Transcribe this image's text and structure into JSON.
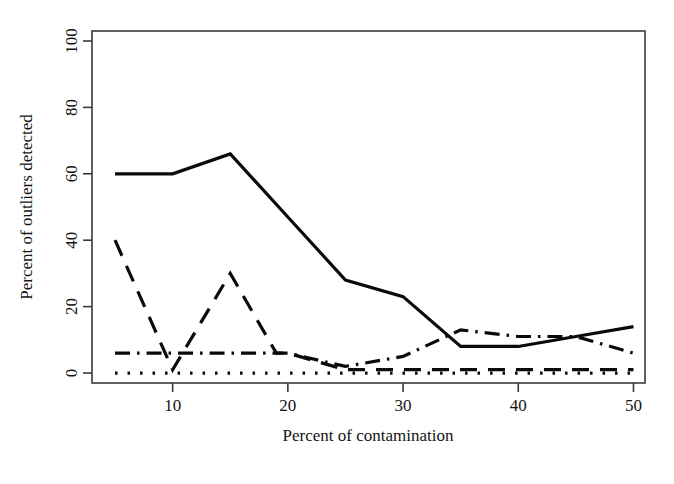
{
  "chart_data": {
    "type": "line",
    "title": "",
    "subtitle": "",
    "xlabel": "Percent of contamination",
    "ylabel": "Percent of outliers detected",
    "xlim": [
      3,
      51
    ],
    "ylim": [
      -3,
      103
    ],
    "xticks": [
      10,
      20,
      30,
      40,
      50
    ],
    "xtick_labels": [
      "10",
      "20",
      "30",
      "40",
      "50"
    ],
    "yticks": [
      0,
      20,
      40,
      60,
      80,
      100
    ],
    "ytick_labels": [
      "0",
      "20",
      "40",
      "60",
      "80",
      "100"
    ],
    "grid": false,
    "legend": "none",
    "frame": "box",
    "series": [
      {
        "name": "solid-line",
        "style": "solid",
        "color": "#0a0a0a",
        "width": 3.2,
        "x": [
          5,
          10,
          15,
          20,
          25,
          30,
          35,
          40,
          45,
          50
        ],
        "values": [
          60,
          60,
          66,
          47,
          28,
          23,
          8,
          8,
          11,
          14
        ]
      },
      {
        "name": "dashed-line",
        "style": "dashed",
        "color": "#0a0a0a",
        "width": 3.2,
        "x": [
          5,
          10,
          15,
          19,
          20,
          25,
          30,
          35,
          40,
          45,
          50
        ],
        "values": [
          40,
          1,
          30,
          6,
          6,
          1,
          1,
          1,
          1,
          1,
          1
        ]
      },
      {
        "name": "dash-dot-line",
        "style": "dashdot",
        "color": "#0a0a0a",
        "width": 3.2,
        "x": [
          5,
          10,
          15,
          20,
          25,
          30,
          35,
          40,
          45,
          50
        ],
        "values": [
          6,
          6,
          6,
          6,
          2,
          5,
          13,
          11,
          11,
          6
        ]
      },
      {
        "name": "dotted-line",
        "style": "dotted",
        "color": "#0a0a0a",
        "width": 3.2,
        "x": [
          5,
          10,
          15,
          20,
          25,
          30,
          35,
          40,
          45,
          50
        ],
        "values": [
          0,
          0,
          0,
          0,
          0,
          0,
          0,
          0,
          0,
          0
        ]
      }
    ]
  }
}
